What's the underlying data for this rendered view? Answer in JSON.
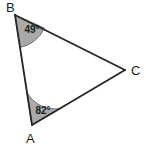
{
  "figure": {
    "type": "triangle-geometry-diagram",
    "background_color": "#ffffff",
    "stroke_color": "#262626",
    "stroke_width": 1.8,
    "wedge_fill_color": "#a9a9a9",
    "wedge_stroke_color": "#6e6e6e",
    "label_color": "#1c1c1c",
    "width": 146,
    "height": 147
  },
  "vertices": [
    {
      "id": "B",
      "label": "B",
      "x": 15,
      "y": 15,
      "label_x": 6,
      "label_y": 12
    },
    {
      "id": "A",
      "label": "A",
      "x": 32,
      "y": 125,
      "label_x": 26,
      "label_y": 143
    },
    {
      "id": "C",
      "label": "C",
      "x": 125,
      "y": 70,
      "label_x": 131,
      "label_y": 75
    }
  ],
  "sides": [
    {
      "id": "BA",
      "from": "B",
      "to": "A",
      "path": "M 15 15 L 32 125"
    },
    {
      "id": "BC",
      "from": "B",
      "to": "C",
      "path": "M 15 15 L 125 70"
    },
    {
      "id": "AC",
      "from": "A",
      "to": "C",
      "path": "M 32 125 L 125 70"
    }
  ],
  "angles": [
    {
      "at": "B",
      "value": "49",
      "unit": "°",
      "text": "49°",
      "label_x": 32,
      "label_y": 33,
      "wedge_path": "M 15 15 L 20.0 47.4 A 32.8 32.8 0 0 0 44.3 28.1 Z"
    },
    {
      "at": "A",
      "value": "82",
      "unit": "°",
      "text": "82°",
      "label_x": 43,
      "label_y": 114,
      "wedge_path": "M 32 125 L 27.0 92.6 A 32.8 32.8 0 0 0 59.6 108.9 Z"
    }
  ]
}
